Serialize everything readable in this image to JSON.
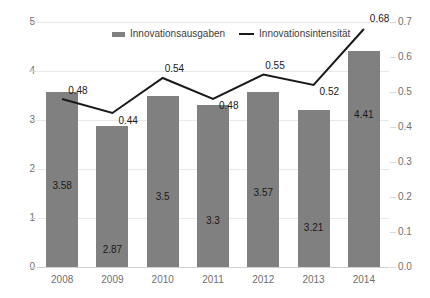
{
  "chart_data": {
    "type": "bar",
    "title": "",
    "subtitle": "",
    "xlabel": "",
    "ylabel": "",
    "categories": [
      "2008",
      "2009",
      "2010",
      "2011",
      "2012",
      "2013",
      "2014"
    ],
    "series": [
      {
        "name": "Innovationsausgaben",
        "type": "bar",
        "axis": "left",
        "color": "#808080",
        "values": [
          3.58,
          2.87,
          3.5,
          3.3,
          3.57,
          3.21,
          4.41
        ],
        "labels": [
          "3.58",
          "2.87",
          "3.5",
          "3.3",
          "3.57",
          "3.21",
          "4.41"
        ]
      },
      {
        "name": "Innovationsintensität",
        "type": "line",
        "axis": "right",
        "color": "#1a1a1a",
        "values": [
          0.48,
          0.44,
          0.54,
          0.48,
          0.55,
          0.52,
          0.68
        ],
        "labels": [
          "0.48",
          "0.44",
          "0.54",
          "0.48",
          "0.55",
          "0.52",
          "0.68"
        ]
      }
    ],
    "left_axis": {
      "min": 0,
      "max": 5,
      "step": 1,
      "ticks": [
        "0",
        "1",
        "2",
        "3",
        "4",
        "5"
      ]
    },
    "right_axis": {
      "min": 0.0,
      "max": 0.7,
      "step": 0.1,
      "ticks": [
        "0.0",
        "0.1",
        "0.2",
        "0.3",
        "0.4",
        "0.5",
        "0.6",
        "0.7"
      ]
    },
    "grid": true,
    "legend_position": "top-center"
  },
  "legend": {
    "items": [
      {
        "label": "Innovationsausgaben"
      },
      {
        "label": "Innovationsintensität"
      }
    ]
  }
}
